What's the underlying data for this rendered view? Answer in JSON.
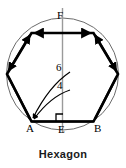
{
  "figure": {
    "caption": "Hexagon",
    "shape": "regular hexagon inscribed in a circle",
    "vertex_labels": {
      "a": "A",
      "b": "B",
      "e": "E",
      "f": "F"
    },
    "dimensions": [
      {
        "value": "6",
        "meaning": "circumradius to vertex A"
      },
      {
        "value": "4",
        "meaning": "apothem to midpoint E"
      }
    ],
    "markers": {
      "right_angle": "right-angle-square-at-E"
    },
    "colors": {
      "hexagon_stroke": "#000000",
      "circle_stroke": "#6b6b6b",
      "axis_stroke": "#9a9a9a",
      "text": "#000000",
      "caption": "#1a1a1a",
      "background": "#ffffff"
    }
  }
}
